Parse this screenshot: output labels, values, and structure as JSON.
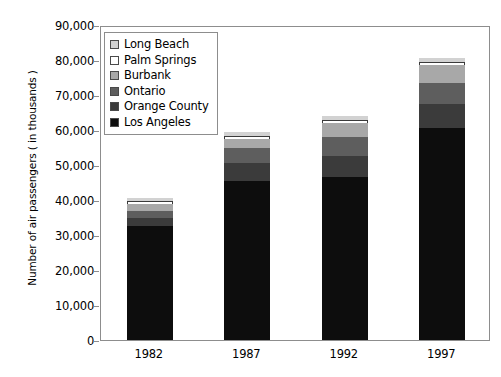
{
  "chart_data": {
    "type": "bar",
    "subtype": "stacked-bar",
    "title": "",
    "xlabel": "",
    "ylabel": "Number of air passengers ( in thousands )",
    "categories": [
      "1982",
      "1987",
      "1992",
      "1997"
    ],
    "ylim": [
      0,
      90000
    ],
    "ytick_step": 10000,
    "yticks": [
      0,
      10000,
      20000,
      30000,
      40000,
      50000,
      60000,
      70000,
      80000,
      90000
    ],
    "ytick_labels": [
      "0",
      "10,000",
      "20,000",
      "30,000",
      "40,000",
      "50,000",
      "60,000",
      "70,000",
      "80,000",
      "90,000"
    ],
    "grid": false,
    "legend_position": "upper-left-inside",
    "stack_order_bottom_to_top": [
      "Los Angeles",
      "Orange County",
      "Ontario",
      "Burbank",
      "Palm Springs",
      "Long Beach"
    ],
    "series": [
      {
        "name": "Los Angeles",
        "color": "#0d0d0d",
        "values": [
          32500,
          45500,
          46500,
          60500
        ]
      },
      {
        "name": "Orange County",
        "color": "#3b3b3b",
        "values": [
          2500,
          5000,
          6000,
          7000
        ]
      },
      {
        "name": "Ontario",
        "color": "#5e5e5e",
        "values": [
          2000,
          4500,
          5500,
          6000
        ]
      },
      {
        "name": "Burbank",
        "color": "#a8a8a8",
        "values": [
          2000,
          2500,
          4000,
          5000
        ]
      },
      {
        "name": "Palm Springs",
        "color": "#ffffff",
        "values": [
          700,
          800,
          900,
          1000
        ]
      },
      {
        "name": "Long Beach",
        "color": "#d2d2d2",
        "values": [
          900,
          1000,
          1100,
          1000
        ]
      }
    ],
    "totals": [
      40600,
      59300,
      64000,
      80500
    ]
  },
  "legend": {
    "items": [
      {
        "label": "Long Beach",
        "color": "#d2d2d2"
      },
      {
        "label": "Palm Springs",
        "color": "#ffffff"
      },
      {
        "label": "Burbank",
        "color": "#a8a8a8"
      },
      {
        "label": "Ontario",
        "color": "#5e5e5e"
      },
      {
        "label": "Orange County",
        "color": "#3b3b3b"
      },
      {
        "label": "Los Angeles",
        "color": "#0d0d0d"
      }
    ]
  },
  "axis": {
    "y_title": "Number of air passengers ( in thousands )",
    "y_labels": [
      "90,000",
      "80,000",
      "70,000",
      "60,000",
      "50,000",
      "40,000",
      "30,000",
      "20,000",
      "10,000",
      "0"
    ],
    "x_labels": [
      "1982",
      "1987",
      "1992",
      "1997"
    ]
  },
  "colors": {
    "frame": "#8d8d8d",
    "text": "#000000",
    "background": "#ffffff"
  }
}
